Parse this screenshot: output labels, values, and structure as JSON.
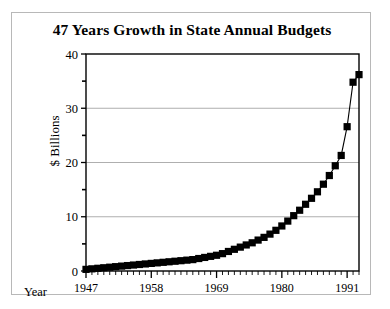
{
  "chart_data": {
    "type": "line",
    "title": "47 Years Growth in State Annual Budgets",
    "xlabel": "Year",
    "ylabel": "$ Billions",
    "ylim": [
      0,
      40
    ],
    "xlim": [
      1947,
      1993
    ],
    "yticks": [
      0,
      10,
      20,
      30,
      40
    ],
    "ytick_minor": [
      5,
      15,
      25,
      35
    ],
    "xticks": [
      1947,
      1958,
      1969,
      1980,
      1991
    ],
    "xtick_minor_step": 1,
    "grid": "horizontal",
    "legend": "none",
    "marker": "square",
    "series_color": "#000000",
    "x": [
      1947,
      1948,
      1949,
      1950,
      1951,
      1952,
      1953,
      1954,
      1955,
      1956,
      1957,
      1958,
      1959,
      1960,
      1961,
      1962,
      1963,
      1964,
      1965,
      1966,
      1967,
      1968,
      1969,
      1970,
      1971,
      1972,
      1973,
      1974,
      1975,
      1976,
      1977,
      1978,
      1979,
      1980,
      1981,
      1982,
      1983,
      1984,
      1985,
      1986,
      1987,
      1988,
      1989,
      1990,
      1991,
      1992,
      1993
    ],
    "values": [
      0.3,
      0.4,
      0.5,
      0.6,
      0.7,
      0.8,
      0.9,
      1.0,
      1.1,
      1.2,
      1.3,
      1.4,
      1.5,
      1.6,
      1.7,
      1.8,
      1.9,
      2.0,
      2.1,
      2.3,
      2.5,
      2.7,
      2.9,
      3.2,
      3.6,
      4.0,
      4.4,
      4.8,
      5.2,
      5.7,
      6.2,
      6.8,
      7.5,
      8.3,
      9.2,
      10.2,
      11.2,
      12.3,
      13.4,
      14.6,
      16.0,
      17.6,
      19.4,
      21.3,
      26.6,
      29.0,
      33.4
    ],
    "values_last": [
      34.8,
      36.2
    ]
  },
  "axis": {
    "ytick_labels": [
      "40",
      "30",
      "20",
      "10",
      "0"
    ],
    "xtick_labels": [
      "1947",
      "1958",
      "1969",
      "1980",
      "1991"
    ]
  }
}
